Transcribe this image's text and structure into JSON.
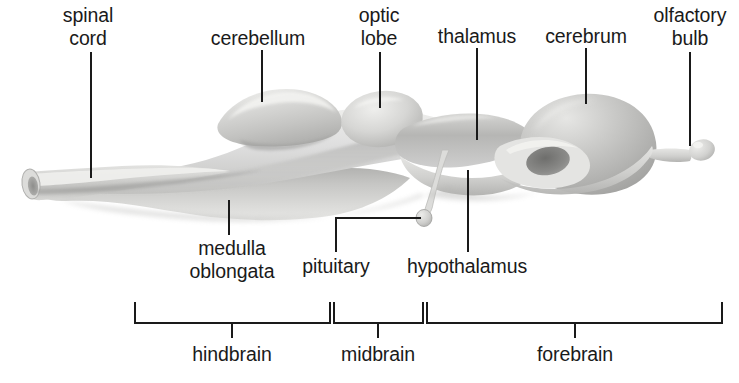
{
  "figure": {
    "type": "anatomical-diagram",
    "background_color": "#ffffff",
    "ink_color": "#1a1a1a",
    "organ_fill_light": "#e8e8e6",
    "organ_fill_mid": "#c9c9c7",
    "organ_fill_dark": "#9e9e9c"
  },
  "callouts": [
    {
      "id": "spinal-cord",
      "label": "spinal\ncord",
      "text_x": 88,
      "text_y": 4,
      "line_x": 91,
      "line_y1": 52,
      "line_y2": 178
    },
    {
      "id": "cerebellum",
      "label": "cerebellum",
      "text_x": 258,
      "text_y": 27,
      "line_x": 262,
      "line_y1": 50,
      "line_y2": 102
    },
    {
      "id": "optic-lobe",
      "label": "optic\nlobe",
      "text_x": 379,
      "text_y": 4,
      "line_x": 380,
      "line_y1": 52,
      "line_y2": 108
    },
    {
      "id": "thalamus",
      "label": "thalamus",
      "text_x": 477,
      "text_y": 25,
      "line_x": 477,
      "line_y1": 48,
      "line_y2": 140
    },
    {
      "id": "cerebrum",
      "label": "cerebrum",
      "text_x": 586,
      "text_y": 25,
      "line_x": 586,
      "line_y1": 48,
      "line_y2": 104
    },
    {
      "id": "olfactory-bulb",
      "label": "olfactory\nbulb",
      "text_x": 690,
      "text_y": 4,
      "line_x": 690,
      "line_y1": 52,
      "line_y2": 146
    },
    {
      "id": "medulla-oblongata",
      "label": "medulla\noblongata",
      "text_x": 232,
      "text_y": 237,
      "line_x": 229,
      "line_y1": 200,
      "line_y2": 235
    },
    {
      "id": "hypothalamus",
      "label": "hypothalamus",
      "text_x": 467,
      "text_y": 255,
      "line_x": 468,
      "line_y1": 170,
      "line_y2": 252
    }
  ],
  "elbow_callout": {
    "id": "pituitary",
    "label": "pituitary",
    "text_x": 336,
    "text_y": 255,
    "vertical_x": 336,
    "vertical_y1": 218,
    "vertical_y2": 252,
    "horizontal_y": 218,
    "horizontal_x1": 336,
    "horizontal_x2": 421
  },
  "regions": [
    {
      "id": "hindbrain",
      "label": "hindbrain",
      "x1": 135,
      "x2": 330,
      "tick_x": 232,
      "label_x": 232
    },
    {
      "id": "midbrain",
      "label": "midbrain",
      "x1": 334,
      "x2": 423,
      "tick_x": 378,
      "label_x": 378
    },
    {
      "id": "forebrain",
      "label": "forebrain",
      "x1": 427,
      "x2": 722,
      "tick_x": 575,
      "label_x": 575
    }
  ],
  "bracket_geometry": {
    "top_y": 302,
    "bar_y": 323,
    "tick_bottom_y": 338,
    "label_y": 343
  }
}
